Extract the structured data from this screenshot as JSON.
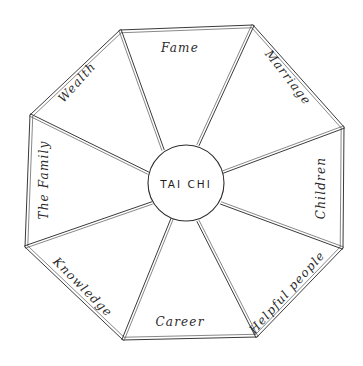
{
  "diagram": {
    "type": "bagua-octagon-sketch",
    "center_label": "TAI CHI",
    "sections": [
      {
        "id": "fame",
        "label": "Fame",
        "position": "top"
      },
      {
        "id": "marriage",
        "label": "Marriage",
        "position": "top-right"
      },
      {
        "id": "children",
        "label": "Children",
        "position": "right"
      },
      {
        "id": "helpful-people",
        "label": "Helpful people",
        "position": "bottom-right"
      },
      {
        "id": "career",
        "label": "Career",
        "position": "bottom"
      },
      {
        "id": "knowledge",
        "label": "Knowledge",
        "position": "bottom-left"
      },
      {
        "id": "the-family",
        "label": "The Family",
        "position": "left"
      },
      {
        "id": "wealth",
        "label": "Wealth",
        "position": "top-left"
      }
    ],
    "colors": {
      "ink": "#2a2a2a",
      "paper": "#ffffff"
    }
  }
}
